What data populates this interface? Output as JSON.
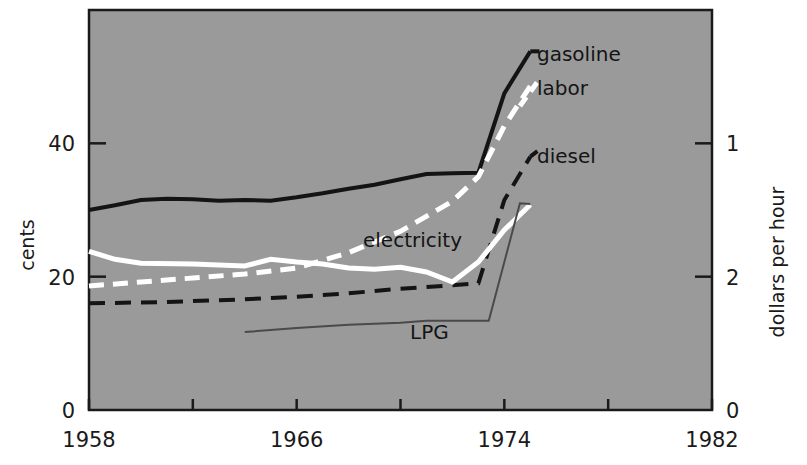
{
  "chart_data": {
    "type": "line",
    "title": "",
    "subtitle": "",
    "plot_background": "#9a9a9a",
    "figure_background": "#ffffff",
    "xlabel": "",
    "ylabel": "cents",
    "y2label": "dollars per hour",
    "xlim": [
      1958,
      1982
    ],
    "ylim": [
      0,
      60
    ],
    "y2lim": [
      0,
      3
    ],
    "grid": false,
    "legend_position": "inline-annotations",
    "x_ticks": [
      1958,
      1962,
      1966,
      1970,
      1974,
      1978,
      1982
    ],
    "x_tick_labels": [
      "1958",
      "",
      "1966",
      "",
      "1974",
      "",
      "1982"
    ],
    "y_ticks": [
      0,
      20,
      40
    ],
    "y_tick_labels": [
      "0",
      "20",
      "40"
    ],
    "y2_ticks": [
      0,
      2,
      1
    ],
    "y2_tick_labels": [
      "0",
      "2",
      "1"
    ],
    "annotations": [
      {
        "text": "gasoline",
        "series": "gasoline",
        "x": 1975.5,
        "y": 54
      },
      {
        "text": "labor",
        "series": "labor",
        "x": 1975.5,
        "y": 49
      },
      {
        "text": "diesel",
        "series": "diesel",
        "x": 1975.5,
        "y": 38
      },
      {
        "text": "electricity",
        "series": "electricity",
        "x": 1968.5,
        "y": 25.5
      },
      {
        "text": "LPG",
        "series": "lpg",
        "x": 1972.0,
        "y": 11.5
      }
    ],
    "series": [
      {
        "name": "gasoline",
        "style": "solid",
        "color": "#141414",
        "width": 4,
        "x": [
          1958,
          1959,
          1960,
          1961,
          1962,
          1963,
          1964,
          1965,
          1966,
          1967,
          1968,
          1969,
          1970,
          1971,
          1972,
          1973,
          1974,
          1975
        ],
        "y": [
          30.0,
          30.7,
          31.5,
          31.7,
          31.6,
          31.4,
          31.5,
          31.4,
          31.9,
          32.5,
          33.2,
          33.8,
          34.6,
          35.4,
          35.5,
          35.6,
          47.5,
          53.8
        ]
      },
      {
        "name": "labor",
        "style": "dashed-white",
        "color": "#ffffff",
        "width": 5,
        "x": [
          1958,
          1960,
          1962,
          1964,
          1966,
          1968,
          1970,
          1972,
          1973,
          1974,
          1975
        ],
        "y": [
          18.6,
          19.2,
          19.8,
          20.4,
          21.3,
          23.6,
          26.8,
          31.3,
          35.0,
          42.6,
          48.6
        ]
      },
      {
        "name": "diesel",
        "style": "dashed-black",
        "color": "#141414",
        "width": 4,
        "x": [
          1958,
          1961,
          1964,
          1966,
          1968,
          1970,
          1972,
          1973,
          1974,
          1975
        ],
        "y": [
          16.0,
          16.2,
          16.6,
          17.0,
          17.5,
          18.2,
          18.7,
          19.0,
          31.5,
          38.0
        ]
      },
      {
        "name": "electricity",
        "style": "solid-white",
        "color": "#ffffff",
        "width": 5,
        "x": [
          1958,
          1959,
          1960,
          1962,
          1964,
          1965,
          1966,
          1967,
          1968,
          1969,
          1970,
          1971,
          1972,
          1973,
          1974,
          1975
        ],
        "y": [
          23.8,
          22.6,
          22.0,
          21.9,
          21.6,
          22.6,
          22.2,
          21.9,
          21.3,
          21.1,
          21.4,
          20.7,
          19.2,
          22.2,
          27.0,
          30.8
        ]
      },
      {
        "name": "lpg",
        "style": "solid-thin",
        "color": "#4a4a4a",
        "width": 2,
        "x": [
          1964,
          1966,
          1968,
          1970,
          1971,
          1972,
          1973,
          1973.4,
          1974.6,
          1975
        ],
        "y": [
          11.7,
          12.3,
          12.8,
          13.1,
          13.4,
          13.4,
          13.4,
          13.4,
          31.0,
          30.9
        ]
      }
    ]
  },
  "axes": {
    "left_title": "cents",
    "right_title": "dollars per hour"
  }
}
